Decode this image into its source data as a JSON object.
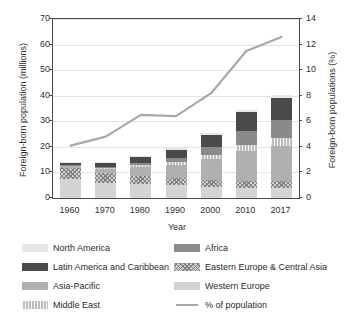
{
  "chart_data": {
    "type": "bar",
    "stacked": true,
    "title": "",
    "xlabel": "Year",
    "ylabel": "Foreign-born population (millions)",
    "ylabel_secondary": "Foreign-born populations (%)",
    "categories": [
      "1960",
      "1970",
      "1980",
      "1990",
      "2000",
      "2010",
      "2017"
    ],
    "ylim": [
      0,
      70
    ],
    "yticks": [
      0,
      10,
      20,
      30,
      40,
      50,
      60,
      70
    ],
    "ylim_secondary": [
      0,
      14
    ],
    "yticks_secondary": [
      0,
      2,
      4,
      6,
      8,
      10,
      12,
      14
    ],
    "grid": true,
    "legend_position": "below",
    "series": [
      {
        "name": "Western Europe",
        "key": "we",
        "color": "#d4d4d4",
        "pattern": "solid",
        "values": [
          7.3,
          6.0,
          5.5,
          4.9,
          4.4,
          4.0,
          3.8
        ]
      },
      {
        "name": "Eastern Europe & Central Asia",
        "key": "eeca",
        "color": "#cfcfcf",
        "pattern": "crosshatch",
        "values": [
          4.6,
          3.8,
          3.3,
          2.9,
          2.7,
          2.8,
          2.9
        ]
      },
      {
        "name": "Asia-Pacific",
        "key": "ap",
        "color": "#b0b0b0",
        "pattern": "solid",
        "values": [
          0.7,
          1.6,
          3.4,
          5.0,
          8.2,
          11.4,
          13.6
        ]
      },
      {
        "name": "Middle East",
        "key": "me",
        "color": "#bdbdbd",
        "pattern": "vstripe",
        "values": [
          0.2,
          0.4,
          0.7,
          1.1,
          1.7,
          2.5,
          3.2
        ]
      },
      {
        "name": "Africa",
        "key": "af",
        "color": "#8a8a8a",
        "pattern": "solid",
        "values": [
          0.2,
          0.4,
          0.9,
          1.6,
          2.8,
          5.4,
          7.2
        ]
      },
      {
        "name": "Latin America and Caribbean",
        "key": "lac",
        "color": "#4a4a4a",
        "pattern": "solid",
        "values": [
          0.8,
          1.6,
          2.3,
          3.4,
          5.0,
          7.4,
          8.4
        ]
      },
      {
        "name": "North America",
        "key": "na",
        "color": "#e8e8e8",
        "pattern": "solid",
        "values": [
          0.3,
          0.4,
          0.4,
          0.5,
          0.7,
          0.9,
          1.0
        ]
      }
    ],
    "totals": [
      14.1,
      20.2,
      24.6,
      25.4,
      33.9,
      49.8,
      55.4
    ],
    "line_series": {
      "name": "% of population",
      "color": "#a8a8a8",
      "axis": "secondary",
      "values": [
        4.1,
        4.8,
        6.5,
        6.4,
        8.2,
        11.5,
        12.6
      ]
    }
  },
  "legend": {
    "items": [
      {
        "label": "North America",
        "key": "na"
      },
      {
        "label": "Africa",
        "key": "af"
      },
      {
        "label": "Latin America and Caribbean",
        "key": "lac"
      },
      {
        "label": "Eastern Europe & Central Asia",
        "key": "eeca"
      },
      {
        "label": "Asia-Pacific",
        "key": "ap"
      },
      {
        "label": "Western Europe",
        "key": "we"
      },
      {
        "label": "Middle East",
        "key": "me"
      },
      {
        "label": "% of population",
        "key": "line"
      }
    ]
  }
}
